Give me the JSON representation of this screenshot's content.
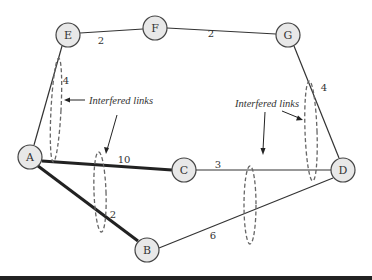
{
  "diagram": {
    "nodes": [
      {
        "id": "E",
        "label": "E",
        "x": 68,
        "y": 35
      },
      {
        "id": "F",
        "label": "F",
        "x": 155,
        "y": 28
      },
      {
        "id": "G",
        "label": "G",
        "x": 288,
        "y": 35
      },
      {
        "id": "A",
        "label": "A",
        "x": 30,
        "y": 157
      },
      {
        "id": "C",
        "label": "C",
        "x": 184,
        "y": 170
      },
      {
        "id": "D",
        "label": "D",
        "x": 343,
        "y": 170
      },
      {
        "id": "B",
        "label": "B",
        "x": 147,
        "y": 250
      }
    ],
    "edges": [
      {
        "from": "E",
        "to": "F",
        "weight": "2",
        "bold": false
      },
      {
        "from": "F",
        "to": "G",
        "weight": "2",
        "bold": false
      },
      {
        "from": "E",
        "to": "A",
        "weight": "4",
        "bold": false
      },
      {
        "from": "G",
        "to": "D",
        "weight": "4",
        "bold": false
      },
      {
        "from": "A",
        "to": "C",
        "weight": "10",
        "bold": true
      },
      {
        "from": "C",
        "to": "D",
        "weight": "3",
        "bold": false
      },
      {
        "from": "A",
        "to": "B",
        "weight": "2",
        "bold": true
      },
      {
        "from": "B",
        "to": "D",
        "weight": "6",
        "bold": false
      }
    ],
    "weight_labels": [
      {
        "text": "2",
        "x": 101,
        "y": 40
      },
      {
        "text": "2",
        "x": 211,
        "y": 33
      },
      {
        "text": "4",
        "x": 65,
        "y": 80
      },
      {
        "text": "4",
        "x": 324,
        "y": 87
      },
      {
        "text": "10",
        "x": 124,
        "y": 159
      },
      {
        "text": "3",
        "x": 218,
        "y": 164
      },
      {
        "text": "2",
        "x": 113,
        "y": 214
      },
      {
        "text": "6",
        "x": 213,
        "y": 235
      }
    ],
    "annotations": [
      {
        "text": "Interfered links",
        "x": 89,
        "y": 104
      },
      {
        "text": "Interfered links",
        "x": 235,
        "y": 107
      }
    ],
    "interference_groups": [
      {
        "cx": 56,
        "cy": 103,
        "rx": 5,
        "ry": 50,
        "rotate": 3
      },
      {
        "cx": 100,
        "cy": 193,
        "rx": 6,
        "ry": 40,
        "rotate": -2
      },
      {
        "cx": 250,
        "cy": 205,
        "rx": 6,
        "ry": 39,
        "rotate": 0
      },
      {
        "cx": 311,
        "cy": 131,
        "rx": 6,
        "ry": 50,
        "rotate": -2
      }
    ]
  }
}
